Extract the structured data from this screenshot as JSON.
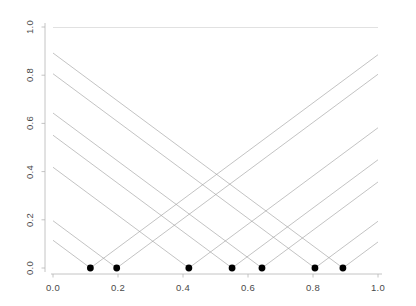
{
  "chart_data": {
    "type": "line",
    "title": "",
    "xlabel": "",
    "ylabel": "",
    "xlim": [
      0.0,
      1.0
    ],
    "ylim": [
      0.0,
      1.0
    ],
    "grid": false,
    "legend": "none",
    "xticks": [
      0.0,
      0.2,
      0.4,
      0.6,
      0.8,
      1.0
    ],
    "xticklabels": [
      "0.0",
      "0.2",
      "0.4",
      "0.6",
      "0.8",
      "1.0"
    ],
    "yticks": [
      0.0,
      0.2,
      0.4,
      0.6,
      0.8,
      1.0
    ],
    "yticklabels": [
      "0.0",
      "0.2",
      "0.4",
      "0.6",
      "0.8",
      "1.0"
    ],
    "points": {
      "name": "knots",
      "marker": "filled-circle",
      "marker_color": "#000000",
      "marker_size": 3.4,
      "x": [
        0.115,
        0.196,
        0.418,
        0.551,
        0.643,
        0.806,
        0.892
      ],
      "y": [
        0.0,
        0.0,
        0.0,
        0.0,
        0.0,
        0.0,
        0.0
      ]
    },
    "series": [
      {
        "name": "v-shape at 0.115",
        "type": "v",
        "vertex_x": 0.115,
        "vertex_y": 0.0,
        "slope": 1.0,
        "color": "#9a9a9a",
        "linewidth": 0.6
      },
      {
        "name": "v-shape at 0.196",
        "type": "v",
        "vertex_x": 0.196,
        "vertex_y": 0.0,
        "slope": 1.0,
        "color": "#9a9a9a",
        "linewidth": 0.6
      },
      {
        "name": "v-shape at 0.418",
        "type": "v",
        "vertex_x": 0.418,
        "vertex_y": 0.0,
        "slope": 1.0,
        "color": "#9a9a9a",
        "linewidth": 0.6
      },
      {
        "name": "v-shape at 0.551",
        "type": "v",
        "vertex_x": 0.551,
        "vertex_y": 0.0,
        "slope": 1.0,
        "color": "#9a9a9a",
        "linewidth": 0.6
      },
      {
        "name": "v-shape at 0.643",
        "type": "v",
        "vertex_x": 0.643,
        "vertex_y": 0.0,
        "slope": 1.0,
        "color": "#9a9a9a",
        "linewidth": 0.6
      },
      {
        "name": "v-shape at 0.806",
        "type": "v",
        "vertex_x": 0.806,
        "vertex_y": 0.0,
        "slope": 1.0,
        "color": "#9a9a9a",
        "linewidth": 0.6
      },
      {
        "name": "v-shape at 0.892",
        "type": "v",
        "vertex_x": 0.892,
        "vertex_y": 0.0,
        "slope": 1.0,
        "color": "#9a9a9a",
        "linewidth": 0.6
      },
      {
        "name": "constant line",
        "type": "hline",
        "y": 1.0,
        "x_start": 0.0,
        "x_end": 1.0,
        "color": "#9a9a9a",
        "linewidth": 0.6
      }
    ],
    "axis_color": "#b5b5b5",
    "tick_color": "#b5b5b5",
    "text_color": "#4a4a4a",
    "background": "#ffffff"
  }
}
